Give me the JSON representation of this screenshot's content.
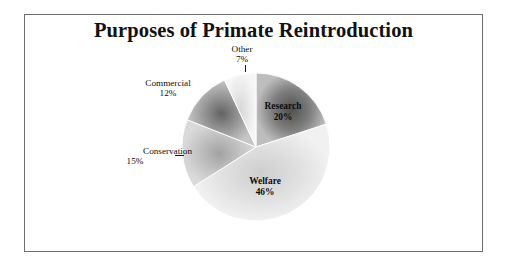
{
  "figure": {
    "background_color": "#ffffff",
    "frame_color": "#6e6e6e",
    "title": "Purposes of Primate Reintroduction"
  },
  "chart_data": {
    "type": "pie",
    "title": "Purposes of Primate Reintroduction",
    "xlabel": "",
    "ylabel": "",
    "units": "percent",
    "total": 100,
    "legend_position": "none",
    "grid": false,
    "label_format": "{name} {value}%",
    "start_angle_deg": 0,
    "direction": "clockwise",
    "categories": [
      "Research",
      "Welfare",
      "Conservation",
      "Commercial",
      "Other"
    ],
    "values": [
      20,
      46,
      15,
      12,
      7
    ],
    "slices": [
      {
        "name": "Research",
        "value": 20,
        "value_label": "20%",
        "color": "#8a8a8a",
        "color_inner": "#5b5b5b",
        "color_outer": "#b9b9b9",
        "label_placement": "inside"
      },
      {
        "name": "Welfare",
        "value": 46,
        "value_label": "46%",
        "color": "#e2e2e2",
        "color_inner": "#d2d2d2",
        "color_outer": "#efefef",
        "label_placement": "inside"
      },
      {
        "name": "Conservation",
        "value": 15,
        "value_label": "15%",
        "color": "#c4c4c4",
        "color_inner": "#a8a8a8",
        "color_outer": "#d8d8d8",
        "label_placement": "outside"
      },
      {
        "name": "Commercial",
        "value": 12,
        "value_label": "12%",
        "color": "#9e9e9e",
        "color_inner": "#6f6f6f",
        "color_outer": "#c2c2c2",
        "label_placement": "outside"
      },
      {
        "name": "Other",
        "value": 7,
        "value_label": "7%",
        "color": "#ededed",
        "color_inner": "#dcdcdc",
        "color_outer": "#f5f5f5",
        "label_placement": "outside"
      }
    ]
  },
  "labels": {
    "other": {
      "name": "Other",
      "pct": "7%"
    },
    "commercial": {
      "name": "Commercial",
      "pct": "12%"
    },
    "conservation": {
      "name": "Conservation",
      "pct": "15%"
    },
    "research": {
      "name": "Research",
      "pct": "20%"
    },
    "welfare": {
      "name": "Welfare",
      "pct": "46%"
    }
  }
}
